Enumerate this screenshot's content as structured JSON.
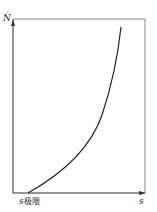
{
  "diagram": {
    "y_axis_label": "Ṅ",
    "x_axis_label": "s",
    "x_origin_label_main": "s",
    "x_origin_label_sub": "极限",
    "colors": {
      "axis": "#777777",
      "curve": "#222222",
      "text": "#222222"
    },
    "curve": {
      "description": "convex increasing curve starting at s_limit on x-axis and rising steeply",
      "points": [
        [
          28,
          193
        ],
        [
          50,
          175
        ],
        [
          75,
          155
        ],
        [
          95,
          130
        ],
        [
          105,
          105
        ],
        [
          112,
          80
        ],
        [
          117,
          55
        ],
        [
          121,
          27
        ]
      ]
    }
  }
}
